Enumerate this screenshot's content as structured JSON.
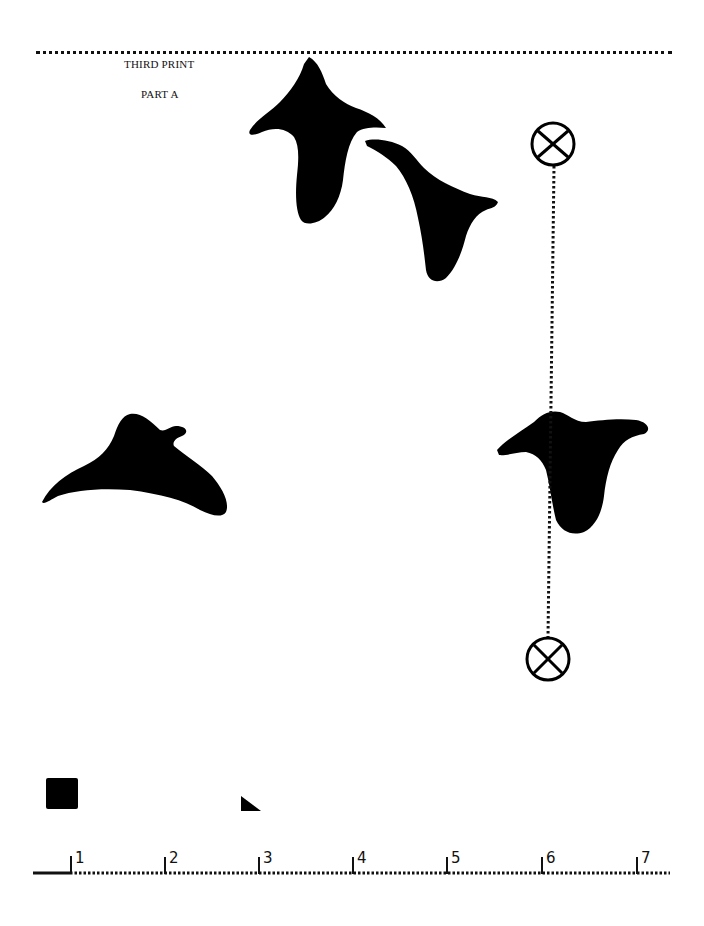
{
  "header": {
    "title": "THIRD PRINT",
    "subtitle": "PART A"
  },
  "figures": [
    {
      "name": "silhouette-1",
      "shape": "manta-ray-top"
    },
    {
      "name": "silhouette-2",
      "shape": "manta-ray-side"
    },
    {
      "name": "silhouette-3",
      "shape": "manta-ray-left"
    },
    {
      "name": "silhouette-4",
      "shape": "manta-ray-right"
    }
  ],
  "markers": [
    {
      "name": "crosshair-marker-top",
      "icon": "circled-x-icon"
    },
    {
      "name": "crosshair-marker-bottom",
      "icon": "circled-x-icon"
    }
  ],
  "swatches": [
    {
      "name": "black-square-swatch"
    },
    {
      "name": "black-triangle-swatch"
    }
  ],
  "ruler": {
    "labels": [
      "1",
      "2",
      "3",
      "4",
      "5",
      "6",
      "7"
    ]
  },
  "colors": {
    "ink": "#000000",
    "paper": "#ffffff"
  }
}
